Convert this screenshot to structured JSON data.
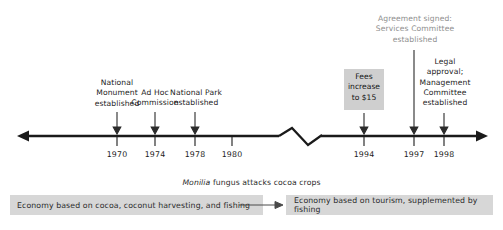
{
  "figure": {
    "axis": {
      "left_arrow": "arrow-left",
      "right_arrow": "arrow-right",
      "break_marker": "zigzag-break"
    },
    "colors": {
      "line": "#1a1a1a",
      "text": "#1d1d1d",
      "callout_box_fill": "#cfcfcf",
      "band_fill": "#d7d7d7",
      "faded_text": "#8e8e8e"
    }
  },
  "years": [
    {
      "label": "1970",
      "x": 117
    },
    {
      "label": "1974",
      "x": 155
    },
    {
      "label": "1978",
      "x": 195
    },
    {
      "label": "1980",
      "x": 232
    },
    {
      "label": "1994",
      "x": 364
    },
    {
      "label": "1997",
      "x": 414
    },
    {
      "label": "1998",
      "x": 444
    }
  ],
  "events": [
    {
      "id": "national-monument",
      "text": "National\nMonument\nestablished",
      "year": "1970",
      "x": 117
    },
    {
      "id": "ad-hoc-commission",
      "text": "Ad Hoc\nCommission",
      "year": "1974",
      "x": 155
    },
    {
      "id": "national-park",
      "text": "National Park\nestablished",
      "year": "1978",
      "x": 195
    },
    {
      "id": "fees-increase",
      "text": "Fees\nincrease\nto $15",
      "year": "1994",
      "x": 364
    },
    {
      "id": "agreement-signed",
      "text": "Agreement signed:\nServices Committee\nestablished",
      "year": "1997",
      "x": 414
    },
    {
      "id": "legal-approval",
      "text": "Legal\napproval;\nManagement\nCommittee\nestablished",
      "year": "1998",
      "x": 444
    }
  ],
  "annotations": {
    "monilia_prefix": "Monilia",
    "monilia_rest": " fungus attacks cocoa crops"
  },
  "bands": [
    {
      "id": "economy-before",
      "text": "Economy based on cocoa, coconut harvesting, and fishing"
    },
    {
      "id": "economy-after",
      "text": "Economy based on tourism, supplemented by fishing"
    }
  ]
}
